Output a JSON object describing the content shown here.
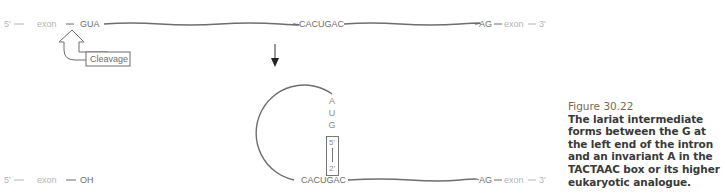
{
  "top_strand": {
    "five_prime": "5'",
    "exon_left": "exon",
    "donor": "GUA",
    "branch": "CACUGAC",
    "acceptor": "AG",
    "exon_right": "exon",
    "three_prime": "3'"
  },
  "cleavage_label": "Cleavage",
  "bottom_left": {
    "five_prime": "5'",
    "exon": "exon",
    "end": "OH"
  },
  "lariat": {
    "letters": [
      "A",
      "U",
      "G"
    ],
    "bond_top": "5'",
    "bond_bottom": "2'",
    "branch": "CACUGAC",
    "acceptor": "AG",
    "exon_right": "exon",
    "three_prime": "3'"
  },
  "caption": {
    "number": "Figure 30.22",
    "text": "The lariat intermediate forms between the G at the left end of the intron and an invariant A in the TACTAAC box or its higher eukaryotic analogue."
  },
  "colors": {
    "line": "#6e6e6e",
    "exon_text": "#b4b4b4",
    "caption_number": "#7a6a52"
  }
}
